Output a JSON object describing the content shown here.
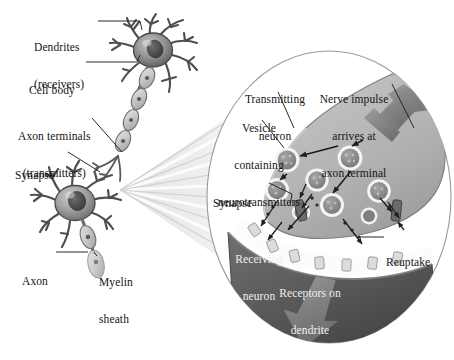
{
  "figure": {
    "background_color": "#ffffff"
  },
  "palette": {
    "paper": "#ffffff",
    "text": "#141414",
    "text_on_dark": "#efefef",
    "neuron_body_light": "#bdbdbd",
    "neuron_body_mid": "#8e8e8e",
    "neuron_body_dark": "#5f5f5f",
    "nucleus": "#4a4a4a",
    "axon_sheath": "#d2d2d2",
    "terminal_fill": "#a8a8a8",
    "receiving_neuron": "#5a5a5a",
    "cleft": "#fbfbfb",
    "vesicle_fill": "#8d8d8d",
    "vesicle_ring": "#f5f5f5",
    "receptor": "#d8d8d8",
    "arrow_dark": "#707070",
    "impulse_arrow": "#7d7d7d",
    "outline": "#8a8a8a",
    "fan_ray": "#cfcfcf",
    "leader_line": "#2b2b2b"
  },
  "left_panel": {
    "name": "whole-neuron-overview",
    "labels": [
      {
        "id": "dendrites",
        "lines": [
          "Dendrites",
          "(receivers)"
        ],
        "x": 34,
        "y": 16,
        "align": "left"
      },
      {
        "id": "cell-body",
        "lines": [
          "Cell body"
        ],
        "x": 29,
        "y": 59,
        "align": "left"
      },
      {
        "id": "axon-terminals",
        "lines": [
          "Axon terminals",
          "(transmitters)"
        ],
        "x": 18,
        "y": 105,
        "align": "left"
      },
      {
        "id": "synapse-left",
        "lines": [
          "Synapse"
        ],
        "x": 15,
        "y": 144,
        "align": "left"
      },
      {
        "id": "axon",
        "lines": [
          "Axon"
        ],
        "x": 22,
        "y": 250,
        "align": "left"
      },
      {
        "id": "myelin-sheath",
        "lines": [
          "Myelin",
          "sheath"
        ],
        "x": 99,
        "y": 251,
        "align": "left"
      }
    ]
  },
  "inset_panel": {
    "name": "synapse-closeup",
    "shape": "ellipse",
    "labels": [
      {
        "id": "transmitting-neuron",
        "lines": [
          "Transmitting",
          "neuron"
        ],
        "x": 275,
        "y": 68,
        "align": "center",
        "color": "dark"
      },
      {
        "id": "nerve-impulse",
        "lines": [
          "Nerve impulse",
          "arrives at",
          "axon terminal"
        ],
        "x": 354,
        "y": 68,
        "align": "center",
        "color": "dark"
      },
      {
        "id": "vesicle",
        "lines": [
          "Vesicle",
          "containing",
          "neurotransmitters"
        ],
        "x": 259,
        "y": 97,
        "align": "center",
        "color": "dark"
      },
      {
        "id": "synapse-inset",
        "lines": [
          "Synapse"
        ],
        "x": 233,
        "y": 177,
        "align": "left",
        "color": "dark"
      },
      {
        "id": "reuptake",
        "lines": [
          "Reuptake"
        ],
        "x": 386,
        "y": 234,
        "align": "left",
        "color": "dark"
      },
      {
        "id": "receiving-neuron",
        "lines": [
          "Receiving",
          "neuron"
        ],
        "x": 259,
        "y": 232,
        "align": "center",
        "color": "light"
      },
      {
        "id": "receptors-on-dendrite",
        "lines": [
          "Receptors on",
          "dendrite"
        ],
        "x": 310,
        "y": 265,
        "align": "center",
        "color": "light"
      }
    ]
  },
  "diagram_elements": {
    "vesicle_count": 8,
    "receptor_count": 7,
    "impulse_arrow_direction": "down-left into axon terminal",
    "output_arrow_direction": "down-left out of receiving neuron"
  }
}
